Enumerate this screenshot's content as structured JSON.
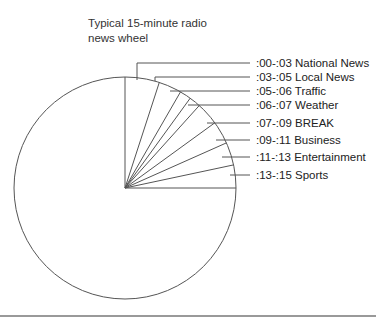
{
  "title": "Typical 15-minute radio news wheel",
  "title_lines": [
    "Typical 15-minute radio",
    "news wheel"
  ],
  "segments": [
    {
      "range": ":00-:03",
      "name": "National News",
      "label": ":00-:03 National News",
      "start": 0,
      "end": 3
    },
    {
      "range": ":03-:05",
      "name": "Local News",
      "label": ":03-:05 Local News",
      "start": 3,
      "end": 5
    },
    {
      "range": ":05-:06",
      "name": "Traffic",
      "label": ":05-:06 Traffic",
      "start": 5,
      "end": 6
    },
    {
      "range": ":06-:07",
      "name": "Weather",
      "label": ":06-:07 Weather",
      "start": 6,
      "end": 7
    },
    {
      "range": ":07-:09",
      "name": "BREAK",
      "label": ":07-:09 BREAK",
      "start": 7,
      "end": 9
    },
    {
      "range": ":09-:11",
      "name": "Business",
      "label": ":09-:11 Business",
      "start": 9,
      "end": 11
    },
    {
      "range": ":11-:13",
      "name": "Entertainment",
      "label": ":11-:13 Entertainment",
      "start": 11,
      "end": 13
    },
    {
      "range": ":13-:15",
      "name": "Sports",
      "label": ":13-:15 Sports",
      "start": 13,
      "end": 15
    }
  ],
  "colors": {
    "line": "#555555",
    "text": "#222222",
    "rule": "#999999"
  }
}
